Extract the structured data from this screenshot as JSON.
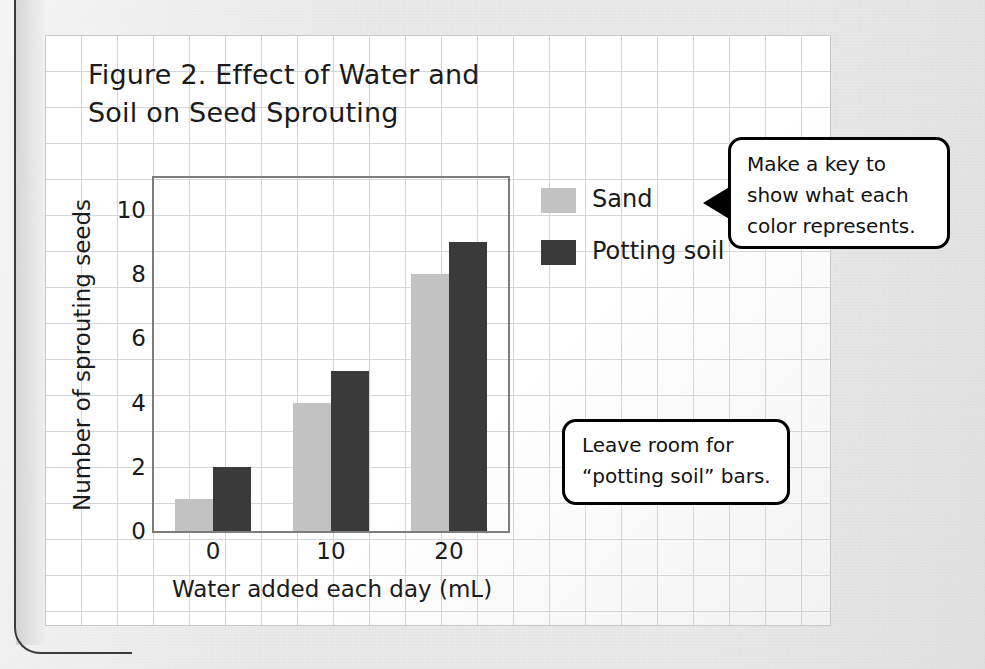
{
  "chart_data": {
    "type": "bar",
    "title": "Figure 2. Effect of Water and\nSoil on Seed Sprouting",
    "xlabel": "Water added each day (mL)",
    "ylabel": "Number of sprouting seeds",
    "categories": [
      "0",
      "10",
      "20"
    ],
    "yticks": [
      "0",
      "2",
      "4",
      "6",
      "8",
      "10"
    ],
    "ylim": [
      0,
      11
    ],
    "grid": false,
    "legend_position": "right",
    "series": [
      {
        "name": "Sand",
        "color": "#c2c2c2",
        "values": [
          1,
          4,
          8
        ]
      },
      {
        "name": "Potting soil",
        "color": "#3a3a3a",
        "values": [
          2,
          5,
          9
        ]
      }
    ]
  },
  "legend": {
    "sand_label": "Sand",
    "soil_label": "Potting soil"
  },
  "callouts": {
    "key": "Make a key to\nshow what each\ncolor represents.",
    "room": "Leave room for\n“potting soil” bars."
  }
}
